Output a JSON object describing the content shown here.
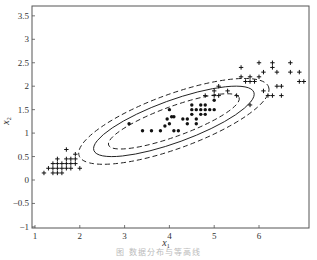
{
  "chart_data": {
    "type": "scatter",
    "title": "",
    "xlabel": "x1",
    "ylabel": "x2",
    "xlim": [
      1,
      7
    ],
    "ylim": [
      -1,
      3.7
    ],
    "x_ticks": [
      "1",
      "2",
      "3",
      "4",
      "5",
      "6"
    ],
    "y_ticks": [
      "-1",
      "-0.5",
      "0",
      "0.5",
      "1",
      "1.5",
      "2",
      "2.5",
      "3",
      "3.5"
    ],
    "grid": false,
    "legend": null,
    "series": [
      {
        "name": "class-dot",
        "marker": "filled-circle",
        "points": [
          [
            3.1,
            1.2
          ],
          [
            3.4,
            1.05
          ],
          [
            3.6,
            1.05
          ],
          [
            3.8,
            1.05
          ],
          [
            3.9,
            1.15
          ],
          [
            3.95,
            1.3
          ],
          [
            4.0,
            1.2
          ],
          [
            4.05,
            1.35
          ],
          [
            4.0,
            1.5
          ],
          [
            4.1,
            1.35
          ],
          [
            4.1,
            1.05
          ],
          [
            4.2,
            1.05
          ],
          [
            4.3,
            1.3
          ],
          [
            4.4,
            1.3
          ],
          [
            4.4,
            1.2
          ],
          [
            4.5,
            1.5
          ],
          [
            4.5,
            1.4
          ],
          [
            4.6,
            1.3
          ],
          [
            4.6,
            1.2
          ],
          [
            4.7,
            1.4
          ],
          [
            4.7,
            1.5
          ],
          [
            4.7,
            1.6
          ],
          [
            4.8,
            1.4
          ],
          [
            4.8,
            1.5
          ],
          [
            4.8,
            1.6
          ],
          [
            4.9,
            1.5
          ],
          [
            5.0,
            1.5
          ],
          [
            5.0,
            1.7
          ],
          [
            4.6,
            1.5
          ],
          [
            4.5,
            1.6
          ]
        ]
      },
      {
        "name": "class-plus",
        "marker": "plus",
        "points": [
          [
            1.2,
            0.15
          ],
          [
            1.3,
            0.25
          ],
          [
            1.4,
            0.25
          ],
          [
            1.4,
            0.35
          ],
          [
            1.5,
            0.25
          ],
          [
            1.5,
            0.35
          ],
          [
            1.5,
            0.15
          ],
          [
            1.6,
            0.25
          ],
          [
            1.6,
            0.35
          ],
          [
            1.6,
            0.15
          ],
          [
            1.7,
            0.25
          ],
          [
            1.7,
            0.45
          ],
          [
            1.7,
            0.35
          ],
          [
            1.8,
            0.35
          ],
          [
            1.8,
            0.45
          ],
          [
            1.8,
            0.25
          ],
          [
            1.9,
            0.35
          ],
          [
            1.9,
            0.55
          ],
          [
            1.7,
            0.65
          ],
          [
            1.9,
            0.45
          ],
          [
            2.0,
            0.25
          ],
          [
            1.4,
            0.15
          ],
          [
            1.5,
            0.45
          ],
          [
            4.8,
            1.8
          ],
          [
            5.0,
            1.8
          ],
          [
            5.1,
            1.8
          ],
          [
            5.1,
            2.0
          ],
          [
            5.3,
            1.9
          ],
          [
            5.6,
            2.4
          ],
          [
            5.6,
            2.2
          ],
          [
            5.5,
            1.8
          ],
          [
            5.7,
            2.1
          ],
          [
            5.8,
            2.1
          ],
          [
            5.8,
            2.2
          ],
          [
            5.9,
            2.1
          ],
          [
            6.0,
            2.2
          ],
          [
            6.0,
            2.5
          ],
          [
            6.1,
            1.9
          ],
          [
            6.1,
            2.3
          ],
          [
            6.2,
            1.8
          ],
          [
            6.3,
            1.8
          ],
          [
            6.3,
            2.4
          ],
          [
            6.4,
            2.3
          ],
          [
            6.4,
            2.0
          ],
          [
            6.5,
            1.8
          ],
          [
            6.5,
            2.0
          ],
          [
            6.7,
            2.5
          ],
          [
            6.7,
            2.3
          ],
          [
            6.9,
            2.3
          ],
          [
            7.0,
            2.1
          ],
          [
            5.8,
            1.6
          ],
          [
            5.0,
            1.9
          ],
          [
            6.3,
            2.5
          ],
          [
            6.9,
            2.1
          ]
        ]
      }
    ],
    "contours": [
      {
        "name": "inner-dashed",
        "style": "dashed",
        "cx": 4.1,
        "cy": 1.25,
        "rx": 1.55,
        "ry": 0.32,
        "angle_deg": -20
      },
      {
        "name": "solid",
        "style": "solid",
        "cx": 4.1,
        "cy": 1.25,
        "rx": 1.9,
        "ry": 0.45,
        "angle_deg": -20
      },
      {
        "name": "outer-dashed",
        "style": "dashed",
        "cx": 4.1,
        "cy": 1.25,
        "rx": 2.25,
        "ry": 0.58,
        "angle_deg": -20
      }
    ]
  },
  "caption": "图 数据分布与等高线"
}
